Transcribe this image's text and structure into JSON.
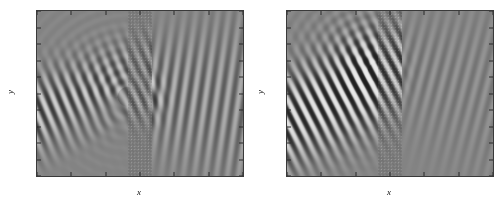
{
  "figure": {
    "panel_count": 2,
    "background_color": "#ffffff",
    "colormap": "grayscale",
    "field_zero_color": "#9c9c9c"
  },
  "chart_data": [
    {
      "type": "heatmap",
      "panel_index": 0,
      "panel_position": "left",
      "title": "",
      "xlabel": "x",
      "ylabel": "y",
      "xlim": [
        -30,
        30
      ],
      "ylim": [
        -25,
        25
      ],
      "xticks": [
        -30,
        -20,
        -10,
        0,
        10,
        20,
        30
      ],
      "xticklabels": [
        "-30",
        "-20",
        "-10",
        "0",
        "10",
        "20",
        "30"
      ],
      "yticks": [
        25,
        20,
        15,
        10,
        5,
        0,
        -5,
        -10,
        -15,
        -20,
        -25
      ],
      "yticklabels": [
        "25",
        "20",
        "15",
        "10",
        "5",
        "0",
        "-5",
        "-10",
        "-15",
        "-20",
        "-25"
      ],
      "grid": false,
      "legend": null,
      "colorbar": false,
      "value_range": [
        -1,
        1
      ],
      "zero_level_gray": 0.61,
      "slab": {
        "x_min": -3.5,
        "x_max": 3.5,
        "y_min": -25,
        "y_max": 25,
        "lattice": "square",
        "lattice_period_x": 1.0,
        "lattice_period_y": 1.0,
        "description": "photonic-crystal slab of circular rods"
      },
      "incident_beam": {
        "origin_x": -30,
        "origin_y": -6,
        "direction_deg": 22,
        "profile": "gaussian",
        "description": "obliquely incident gaussian beam from lower-left"
      },
      "transmitted_beam": {
        "present": true,
        "relative_amplitude": 0.45,
        "exit_x": 3.5,
        "exit_y": 1,
        "direction_deg": -8,
        "description": "broad weak transmitted lobes spreading into x > 4"
      },
      "reflected_beam": {
        "present": true,
        "relative_amplitude": 0.35,
        "description": "weak backscatter mixing with the incident field"
      },
      "features": [
        "strong incident gaussian beam entering from lower-left corner",
        "strong localised field inside the slab near y = 0 and y = -5",
        "pronounced transmission into the right half-space",
        "interference fringes between incident and reflected waves on the left"
      ]
    },
    {
      "type": "heatmap",
      "panel_index": 1,
      "panel_position": "right",
      "title": "",
      "xlabel": "x",
      "ylabel": "y",
      "xlim": [
        -30,
        30
      ],
      "ylim": [
        -25,
        25
      ],
      "xticks": [
        -30,
        -20,
        -10,
        0,
        10,
        20,
        30
      ],
      "xticklabels": [
        "-30",
        "-20",
        "-10",
        "0",
        "10",
        "20",
        "30"
      ],
      "yticks": [
        25,
        20,
        15,
        10,
        5,
        0,
        -5,
        -10,
        -15,
        -20,
        -25
      ],
      "yticklabels": [
        "25",
        "20",
        "15",
        "10",
        "5",
        "0",
        "-5",
        "-10",
        "-15",
        "-20",
        "-25"
      ],
      "grid": false,
      "legend": null,
      "colorbar": false,
      "value_range": [
        -1,
        1
      ],
      "zero_level_gray": 0.61,
      "slab": {
        "x_min": -3.5,
        "x_max": 3.5,
        "y_min": -25,
        "y_max": 25,
        "lattice": "square",
        "lattice_period_x": 1.0,
        "lattice_period_y": 1.0,
        "description": "photonic-crystal slab of circular rods"
      },
      "incident_beam": {
        "origin_x": -30,
        "origin_y": -8,
        "direction_deg": 26,
        "profile": "gaussian",
        "description": "obliquely incident gaussian beam from lower-left"
      },
      "transmitted_beam": {
        "present": true,
        "relative_amplitude": 0.18,
        "exit_x": 3.5,
        "exit_y": 8,
        "direction_deg": -14,
        "description": "faint diffuse transmission into x > 4"
      },
      "reflected_beam": {
        "present": true,
        "relative_amplitude": 0.9,
        "direction_deg": -26,
        "description": "strong specular reflection forming a bright lobe cluster around x = -8, y = 6"
      },
      "features": [
        "strong incident gaussian beam entering from lower-left corner",
        "large high-amplitude standing-wave lobe cluster just left of the slab near y = 5 to 12",
        "much weaker transmission than the left panel",
        "wide interference fan radiating toward the upper-left corner"
      ]
    }
  ],
  "panels": [
    {
      "name": "panel-a",
      "xlabel": "x",
      "ylabel": "y",
      "xticklabels": [
        "-30",
        "-20",
        "-10",
        "0",
        "10",
        "20",
        "30"
      ],
      "yticklabels": [
        "25",
        "20",
        "15",
        "10",
        "5",
        "0",
        "-5",
        "-10",
        "-15",
        "-20",
        "-25"
      ]
    },
    {
      "name": "panel-b",
      "xlabel": "x",
      "ylabel": "y",
      "xticklabels": [
        "-30",
        "-20",
        "-10",
        "0",
        "10",
        "20",
        "30"
      ],
      "yticklabels": [
        "25",
        "20",
        "15",
        "10",
        "5",
        "0",
        "-5",
        "-10",
        "-15",
        "-20",
        "-25"
      ]
    }
  ]
}
